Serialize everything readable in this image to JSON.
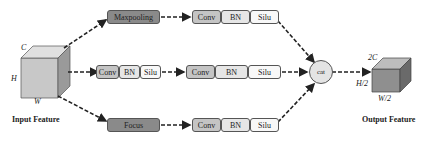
{
  "input": {
    "caption": "Input Feature",
    "dims": {
      "c": "C",
      "h": "H",
      "w": "W"
    }
  },
  "output": {
    "caption": "Output Feature",
    "dims": {
      "c": "2C",
      "h": "H/2",
      "w": "W/2"
    }
  },
  "branches": [
    {
      "pre": "Maxpooling",
      "block": [
        "Conv",
        "BN",
        "Silu"
      ]
    },
    {
      "pre_block": [
        "Conv",
        "BN",
        "Silu"
      ],
      "block": [
        "Conv",
        "BN",
        "Silu"
      ]
    },
    {
      "pre": "Focus",
      "block": [
        "Conv",
        "BN",
        "Silu"
      ]
    }
  ],
  "merge": {
    "label": "cat"
  },
  "colors": {
    "dark_op": "#8a8a8a",
    "conv": "#c4c4c4",
    "bn": "#e6e6e6",
    "silu": "#f8f8f8",
    "arrow": "#222222",
    "cube_front": "#c8c8c8",
    "cube_top": "#e0e0e0",
    "cube_side": "#9a9a9a",
    "out_front": "#8f8f8f",
    "out_top": "#bdbdbd",
    "out_side": "#6a6a6a"
  }
}
